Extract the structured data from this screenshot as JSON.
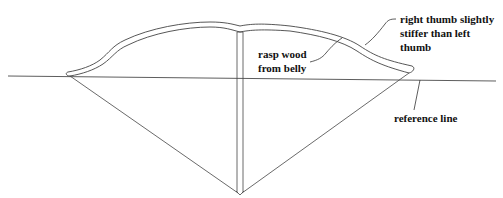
{
  "diagram": {
    "labels": {
      "right_thumb_line1": "right thumb slightly",
      "right_thumb_line2": "stiffer than left",
      "right_thumb_line3": "thumb",
      "rasp_line1": "rasp wood",
      "rasp_line2": "from belly",
      "reference": "reference line"
    },
    "colors": {
      "stroke": "#333333",
      "text": "#111111",
      "background": "#ffffff"
    }
  }
}
